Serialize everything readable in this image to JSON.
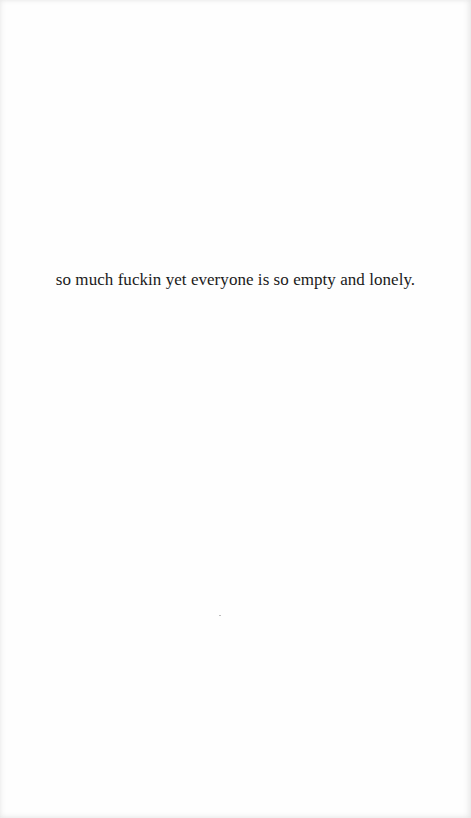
{
  "page": {
    "background": "#fefefe",
    "text_color": "#1a1a1a"
  },
  "quote": {
    "text": "so much fuckin yet everyone is so empty and lonely."
  }
}
